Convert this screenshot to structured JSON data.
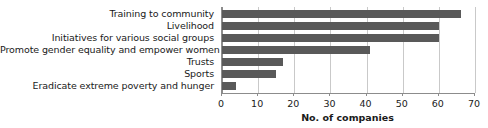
{
  "chart_data": {
    "type": "bar",
    "orientation": "horizontal",
    "title": "",
    "xlabel": "No. of companies",
    "ylabel": "",
    "xlim": [
      0,
      70
    ],
    "xticks": [
      0,
      10,
      20,
      30,
      40,
      50,
      60,
      70
    ],
    "grid": true,
    "legend": false,
    "bar_color": "#595959",
    "categories": [
      "Training to community",
      "Livelihood",
      "Initiatives for various social groups",
      "Promote gender equality and empower women",
      "Trusts",
      "Sports",
      "Eradicate extreme poverty and hunger"
    ],
    "values": [
      66,
      60,
      60,
      41,
      17,
      15,
      4
    ]
  }
}
